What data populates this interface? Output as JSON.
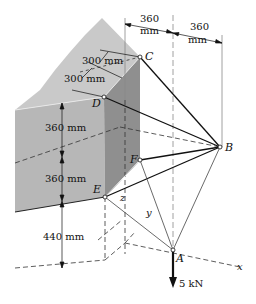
{
  "figure": {
    "points": {
      "A": "A",
      "B": "B",
      "C": "C",
      "D": "D",
      "E": "E",
      "F": "F"
    },
    "axes": {
      "x": "x",
      "y": "y",
      "z": "z"
    },
    "dimensions": {
      "top_width_1_value": "360",
      "top_width_1_unit": "mm",
      "top_width_2_value": "360",
      "top_width_2_unit": "mm",
      "depth_1": "300 mm",
      "depth_2": "300 mm",
      "height_upper": "360 mm",
      "height_lower": "360 mm",
      "height_base": "440 mm"
    },
    "load": {
      "label": "5 kN"
    },
    "colors": {
      "wall_top": "#c8c8c8",
      "wall_front": "#b4b4b4",
      "wall_side": "#8e8e8e",
      "line": "#111111",
      "dashed": "#555555"
    }
  }
}
